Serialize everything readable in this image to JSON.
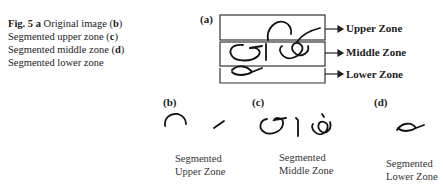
{
  "figure": {
    "number": "Fig. 5",
    "caption_parts": [
      {
        "text": "Fig. 5",
        "bold": true
      },
      {
        "text": "  ",
        "bold": false
      },
      {
        "text": "a",
        "bold": true
      },
      {
        "text": " Original image (",
        "bold": false
      },
      {
        "text": "b",
        "bold": true
      },
      {
        "text": ") Segmented upper zone (",
        "bold": false
      },
      {
        "text": "c",
        "bold": true
      },
      {
        "text": ") Segmented middle zone (",
        "bold": false
      },
      {
        "text": "d",
        "bold": true
      },
      {
        "text": ") Segmented lower zone",
        "bold": false
      }
    ]
  },
  "panel_a": {
    "label": "(a)",
    "zones": [
      "Upper Zone",
      "Middle Zone",
      "Lower Zone"
    ]
  },
  "panels": [
    {
      "label": "(b)",
      "caption_line1": "Segmented",
      "caption_line2": "Upper Zone"
    },
    {
      "label": "(c)",
      "caption_line1": "Segmented",
      "caption_line2": "Middle Zone"
    },
    {
      "label": "(d)",
      "caption_line1": "Segmented",
      "caption_line2": "Lower Zone"
    }
  ],
  "colors": {
    "ink": "#222222",
    "background": "#ffffff"
  }
}
